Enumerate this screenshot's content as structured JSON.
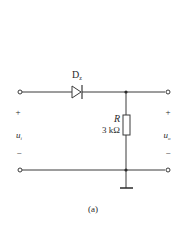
{
  "diagram": {
    "type": "circuit-schematic",
    "components": {
      "diode": {
        "label_main": "D",
        "label_sub": "z"
      },
      "resistor": {
        "symbol": "R",
        "value": "3 kΩ"
      }
    },
    "input": {
      "plus": "+",
      "minus": "−",
      "label_main": "u",
      "label_sub": "i"
    },
    "output": {
      "plus": "+",
      "minus": "−",
      "label_main": "u",
      "label_sub": "o"
    },
    "caption": "(a)"
  }
}
